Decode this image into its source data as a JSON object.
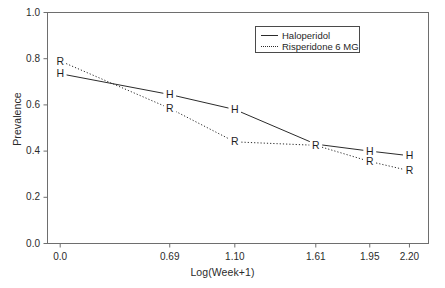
{
  "chart_data": {
    "type": "line",
    "title": "",
    "xlabel": "Log(Week+1)",
    "ylabel": "Prevalence",
    "xlim": [
      -0.08,
      2.32
    ],
    "ylim": [
      0.0,
      1.0
    ],
    "grid": false,
    "legend_position": "top-right",
    "x": [
      0.0,
      0.69,
      1.1,
      1.61,
      1.95,
      2.2
    ],
    "xticks": [
      "0.0",
      "0.69",
      "1.10",
      "1.61",
      "1.95",
      "2.20"
    ],
    "yticks": [
      "0.0",
      "0.2",
      "0.4",
      "0.6",
      "0.8",
      "1.0"
    ],
    "series": [
      {
        "name": "Haloperidol",
        "marker": "H",
        "linestyle": "solid",
        "color": "#2b2b2b",
        "values": [
          0.735,
          0.645,
          0.58,
          0.43,
          0.4,
          0.38
        ]
      },
      {
        "name": "Risperidone 6 MG",
        "marker": "R",
        "linestyle": "dotted",
        "color": "#2b2b2b",
        "values": [
          0.79,
          0.585,
          0.44,
          0.425,
          0.355,
          0.315
        ]
      }
    ]
  },
  "legend": {
    "entries": [
      {
        "label": "Haloperidol",
        "style": "solid"
      },
      {
        "label": "Risperidone 6 MG",
        "style": "dotted"
      }
    ]
  }
}
